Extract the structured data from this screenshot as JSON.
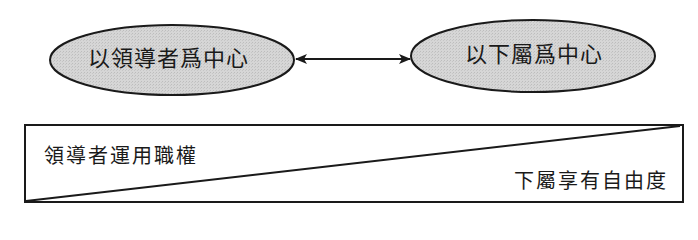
{
  "diagram": {
    "type": "leadership-continuum",
    "nodes": [
      {
        "id": "leader-centered",
        "label": "以領導者爲中心",
        "fill": "#d4d4d4"
      },
      {
        "id": "subordinate-centered",
        "label": "以下屬爲中心",
        "fill": "#d4d4d4"
      }
    ],
    "connector": {
      "from": "leader-centered",
      "to": "subordinate-centered",
      "style": "double-arrow"
    },
    "continuum_bar": {
      "left_label": "領導者運用職權",
      "right_label": "下屬享有自由度"
    }
  },
  "colors": {
    "stroke": "#1a1a1a",
    "ellipse_fill": "#d4d4d4",
    "background": "#ffffff"
  }
}
